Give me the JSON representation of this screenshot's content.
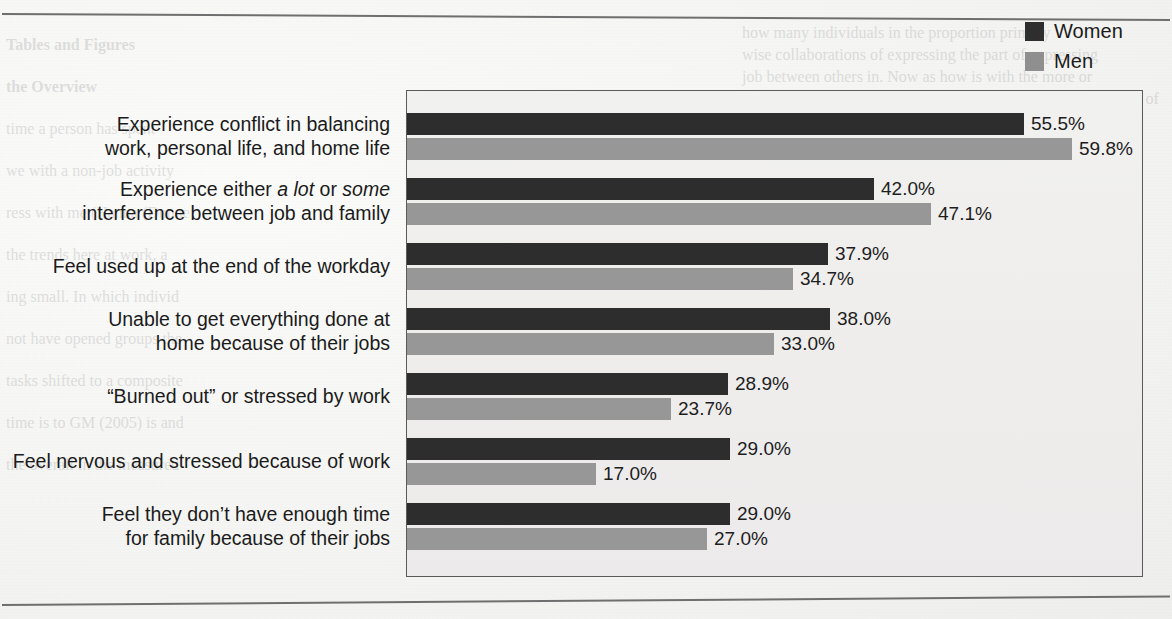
{
  "page": {
    "rule_top": "horizontal-rule",
    "rule_bottom": "horizontal-rule"
  },
  "ghost_text": {
    "left_column": [
      "Tables and Figures",
      "the Overview",
      "time a person has spent",
      "we with a non-job activity",
      "ress with me (Hanna (Dunne",
      "the trends here at work, a",
      "ing small. In which individ",
      "not have opened groups the",
      "tasks shifted to a composite",
      "time is to GM (2005) is and",
      "the overall in the measured"
    ],
    "right_column": [
      "how many individuals in the proportion primary",
      "wise collaborations of expressing the part of expressing",
      "job between others in. Now as how is with the more or",
      "these measures of exchange in when the crease, a the channels of"
    ]
  },
  "legend": {
    "position": "top-right",
    "entries": [
      {
        "label": "Women",
        "color": "#2e2e2e"
      },
      {
        "label": "Men",
        "color": "#8f8f8f"
      }
    ]
  },
  "chart_data": {
    "type": "bar",
    "orientation": "horizontal",
    "title": "",
    "xlabel": "",
    "ylabel": "",
    "xlim": [
      0,
      66
    ],
    "grid": false,
    "legend_position": "top-right",
    "categories": [
      "Experience conflict in balancing work, personal life, and home life",
      "Experience either a lot or some interference between job and family",
      "Feel used up at the end of the workday",
      "Unable to get everything done at home because of their jobs",
      "“Burned out” or stressed by work",
      "Feel nervous and stressed because of work",
      "Feel they don’t have enough time for family because of their jobs"
    ],
    "category_lines": [
      [
        "Experience conflict in balancing",
        "work, personal life, and home life"
      ],
      [
        "Experience either <em>a lot</em> or <em>some</em>",
        "interference between job and family"
      ],
      [
        "Feel used up at the end of the workday"
      ],
      [
        "Unable to get everything done at",
        "home because of their jobs"
      ],
      [
        "“Burned out” or stressed by work"
      ],
      [
        "Feel nervous and stressed because of work"
      ],
      [
        "Feel they don’t have enough time",
        "for family because of their jobs"
      ]
    ],
    "series": [
      {
        "name": "Women",
        "color": "#2d2d2d",
        "values": [
          55.5,
          42.0,
          37.9,
          38.0,
          28.9,
          29.0,
          29.0
        ],
        "labels": [
          "55.5%",
          "42.0%",
          "37.9%",
          "38.0%",
          "28.9%",
          "29.0%",
          "29.0%"
        ]
      },
      {
        "name": "Men",
        "color": "#979797",
        "values": [
          59.8,
          47.1,
          34.7,
          33.0,
          23.7,
          17.0,
          27.0
        ],
        "labels": [
          "59.8%",
          "47.1%",
          "34.7%",
          "33.0%",
          "23.7%",
          "17.0%",
          "27.0%"
        ]
      }
    ]
  }
}
